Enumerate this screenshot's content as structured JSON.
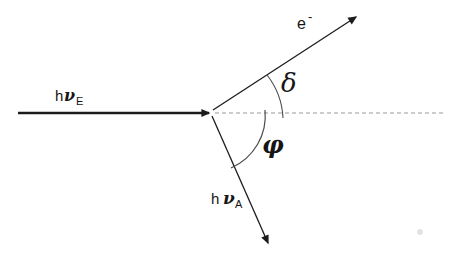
{
  "diagram": {
    "background_color": "#ffffff",
    "line_color": "#1c1c1c",
    "arc_color": "#4a4a4a",
    "dashed_line_color": "#999999",
    "labels": {
      "incident_photon": {
        "prefix": "h",
        "symbol": "ν",
        "subscript": "E"
      },
      "electron": {
        "base": "e",
        "superscript": "-"
      },
      "upper_angle": "δ",
      "lower_angle": "φ",
      "scattered_photon": {
        "prefix": "h",
        "symbol": "ν",
        "subscript": "A"
      }
    }
  }
}
